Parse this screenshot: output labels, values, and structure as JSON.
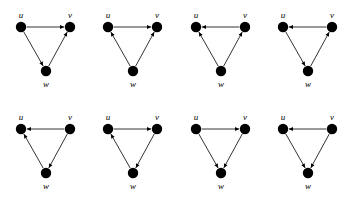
{
  "figure": {
    "background_color": "#ffffff",
    "node_color": "#000000",
    "edge_color": "#000000",
    "node_labels": {
      "u": "u",
      "v": "v",
      "w": "w"
    },
    "layout": {
      "columns": 4,
      "rows": 2,
      "node_positions": {
        "u": {
          "x": 21,
          "y": 27
        },
        "v": {
          "x": 70,
          "y": 27
        },
        "w": {
          "x": 46,
          "y": 71
        }
      },
      "node_radius": 5.2
    },
    "graphs": [
      {
        "index": 1,
        "name": "graph-1",
        "nodes": [
          "u",
          "v",
          "w"
        ],
        "edges": [
          {
            "from": "u",
            "to": "v"
          },
          {
            "from": "u",
            "to": "w"
          },
          {
            "from": "w",
            "to": "v"
          }
        ]
      },
      {
        "index": 2,
        "name": "graph-2",
        "nodes": [
          "u",
          "v",
          "w"
        ],
        "edges": [
          {
            "from": "u",
            "to": "v"
          },
          {
            "from": "w",
            "to": "u"
          },
          {
            "from": "w",
            "to": "v"
          }
        ]
      },
      {
        "index": 3,
        "name": "graph-3",
        "nodes": [
          "u",
          "v",
          "w"
        ],
        "edges": [
          {
            "from": "v",
            "to": "u"
          },
          {
            "from": "w",
            "to": "u"
          },
          {
            "from": "w",
            "to": "v"
          }
        ]
      },
      {
        "index": 4,
        "name": "graph-4",
        "nodes": [
          "u",
          "v",
          "w"
        ],
        "edges": [
          {
            "from": "v",
            "to": "u"
          },
          {
            "from": "u",
            "to": "w"
          },
          {
            "from": "w",
            "to": "v"
          }
        ]
      },
      {
        "index": 5,
        "name": "graph-5",
        "nodes": [
          "u",
          "v",
          "w"
        ],
        "edges": [
          {
            "from": "v",
            "to": "u"
          },
          {
            "from": "w",
            "to": "u"
          },
          {
            "from": "v",
            "to": "w"
          }
        ]
      },
      {
        "index": 6,
        "name": "graph-6",
        "nodes": [
          "u",
          "v",
          "w"
        ],
        "edges": [
          {
            "from": "u",
            "to": "v"
          },
          {
            "from": "w",
            "to": "u"
          },
          {
            "from": "v",
            "to": "w"
          }
        ]
      },
      {
        "index": 7,
        "name": "graph-7",
        "nodes": [
          "u",
          "v",
          "w"
        ],
        "edges": [
          {
            "from": "u",
            "to": "v"
          },
          {
            "from": "u",
            "to": "w"
          },
          {
            "from": "v",
            "to": "w"
          }
        ]
      },
      {
        "index": 8,
        "name": "graph-8",
        "nodes": [
          "u",
          "v",
          "w"
        ],
        "edges": [
          {
            "from": "v",
            "to": "u"
          },
          {
            "from": "u",
            "to": "w"
          },
          {
            "from": "v",
            "to": "w"
          }
        ]
      }
    ]
  }
}
